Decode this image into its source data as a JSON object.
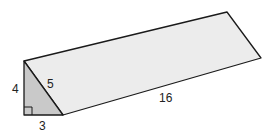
{
  "figure": {
    "type": "triangular-prism",
    "colors": {
      "triangle_face": "#c9c9c9",
      "long_face": "#ececec",
      "edge": "#1a1a1a"
    },
    "labels": {
      "height": "4",
      "hypotenuse": "5",
      "base": "3",
      "length": "16"
    },
    "right_angle_marker": true
  }
}
